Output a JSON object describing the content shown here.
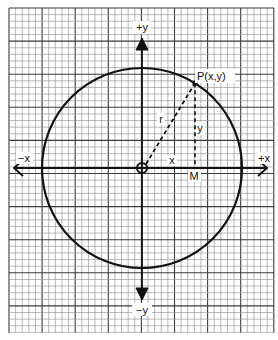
{
  "figure": {
    "type": "coordinate-circle",
    "colors": {
      "background": "#ffffff",
      "grid_minor": "#9a9a9a",
      "grid_major": "#3a3a3a",
      "ink": "#111111"
    },
    "grid": {
      "minor_cells_per_major": 5
    },
    "axes": {
      "x_positive_label": "+x",
      "x_negative_label": "−x",
      "y_positive_label": "+y",
      "y_negative_label": "−y"
    },
    "circle": {
      "radius_label": "r",
      "center": "origin"
    },
    "point": {
      "label": "P(x,y)",
      "angle_deg": 58
    },
    "foot_point": {
      "label": "M"
    },
    "segment_labels": {
      "horizontal": "x",
      "vertical": "y"
    }
  }
}
